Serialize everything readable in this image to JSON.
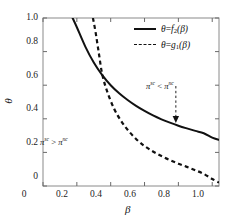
{
  "chart_data": {
    "type": "line",
    "title": "",
    "xlabel": "β",
    "ylabel": "θ",
    "xlim": [
      0,
      1.04
    ],
    "ylim": [
      0,
      1.0
    ],
    "grid": false,
    "legend_position": "upper-right",
    "xticks": [
      "0",
      "0.2",
      "0.4",
      "0.6",
      "0.8",
      "1.0"
    ],
    "xtick_values": [
      0,
      0.2,
      0.4,
      0.6,
      0.8,
      1.0
    ],
    "yticks": [
      "0",
      "0.2",
      "0.4",
      "0.6",
      "0.8",
      "1.0"
    ],
    "ytick_values": [
      0,
      0.2,
      0.4,
      0.6,
      0.8,
      1.0
    ],
    "series": [
      {
        "name": "θ=f₂ (β)",
        "style": "solid",
        "color": "#111111",
        "x": [
          0.175,
          0.2,
          0.25,
          0.3,
          0.35,
          0.4,
          0.45,
          0.5,
          0.55,
          0.6,
          0.65,
          0.7,
          0.75,
          0.8,
          0.85,
          0.9,
          0.95,
          1.0,
          1.04
        ],
        "y": [
          1.0,
          0.945,
          0.83,
          0.735,
          0.66,
          0.6,
          0.552,
          0.512,
          0.477,
          0.447,
          0.42,
          0.397,
          0.377,
          0.359,
          0.343,
          0.328,
          0.314,
          0.288,
          0.275
        ]
      },
      {
        "name": "θ=g₁ (β)",
        "style": "dashed",
        "color": "#111111",
        "x": [
          0.295,
          0.31,
          0.33,
          0.35,
          0.38,
          0.42,
          0.46,
          0.5,
          0.55,
          0.6,
          0.65,
          0.7,
          0.75,
          0.8,
          0.85,
          0.9,
          0.95,
          1.0,
          1.04
        ],
        "y": [
          1.0,
          0.92,
          0.79,
          0.665,
          0.56,
          0.46,
          0.39,
          0.335,
          0.28,
          0.238,
          0.205,
          0.178,
          0.154,
          0.133,
          0.114,
          0.094,
          0.072,
          0.042,
          0.02
        ]
      }
    ],
    "intersection": {
      "x": 0.35,
      "y": 0.66
    },
    "annotations": [
      {
        "name": "region-label-upper-right",
        "text": "π^sc < π^nc",
        "pi_left_sup": "sc",
        "pi_right_sup": "nc",
        "relation": "<",
        "x": 0.8,
        "y": 0.64
      },
      {
        "name": "region-label-lower-left",
        "text": "π^sc > π^nc",
        "pi_left_sup": "sc",
        "pi_right_sup": "nc",
        "relation": ">",
        "x": 0.21,
        "y": 0.3
      }
    ],
    "arrow": {
      "name": "downward-dashed-arrow",
      "x": 0.785,
      "y_start": 0.595,
      "y_end": 0.375,
      "style": "dashed",
      "head": "filled-triangle"
    }
  },
  "legend": {
    "items": [
      {
        "label_full": "θ=f₂ (β)",
        "theta": "θ",
        "eq": "=",
        "fn": "f",
        "sub": "2",
        "arg": "(β)",
        "style": "solid"
      },
      {
        "label_full": "θ=g₁ (β)",
        "theta": "θ",
        "eq": "=",
        "fn": "g",
        "sub": "1",
        "arg": "(β)",
        "style": "dashed"
      }
    ]
  },
  "axes": {
    "x_title": "β",
    "y_title": "θ",
    "x_tick_labels": [
      "0",
      "0.2",
      "0.4",
      "0.6",
      "0.8",
      "1.0"
    ],
    "y_tick_labels": [
      "0",
      "0.2",
      "0.4",
      "0.6",
      "0.8",
      "1.0"
    ]
  },
  "symbols": {
    "pi": "π",
    "sup_sc": "sc",
    "sup_nc": "nc",
    "less_than": "<",
    "greater_than": ">"
  }
}
